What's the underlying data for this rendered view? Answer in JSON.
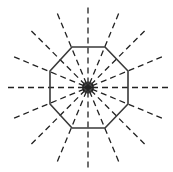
{
  "diagram": {
    "shape": "octagon",
    "sides": 8,
    "lines_of_symmetry": 8,
    "rays": 16,
    "ray_angle_step_deg": 22.5,
    "center": [
      88,
      87.5
    ],
    "octagon_vertices": [
      [
        72,
        47
      ],
      [
        105,
        47
      ],
      [
        128,
        71
      ],
      [
        128,
        104
      ],
      [
        105,
        128
      ],
      [
        72,
        128
      ],
      [
        50,
        104
      ],
      [
        50,
        71
      ]
    ],
    "ray_inner_radius": 4,
    "ray_outer_radius": 80,
    "colors": {
      "outline": "#3a3a3a",
      "symmetry_lines": "#222222",
      "background": "#ffffff"
    },
    "dash_pattern": "6 4"
  }
}
